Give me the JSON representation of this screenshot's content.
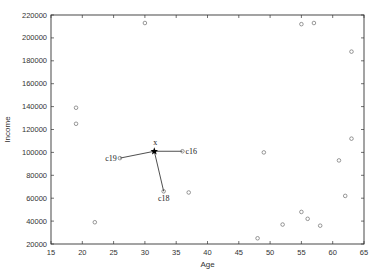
{
  "chart_data": {
    "type": "scatter",
    "title": "",
    "xlabel": "Age",
    "ylabel": "Income",
    "xlim": [
      15,
      65
    ],
    "ylim": [
      20000,
      220000
    ],
    "xticks": [
      "15",
      "20",
      "25",
      "30",
      "35",
      "40",
      "45",
      "50",
      "55",
      "60",
      "65"
    ],
    "yticks": [
      "20000",
      "40000",
      "60000",
      "80000",
      "100000",
      "120000",
      "140000",
      "160000",
      "180000",
      "200000",
      "220000"
    ],
    "grid": false,
    "legend": null,
    "points": [
      {
        "x": 19,
        "y": 139000
      },
      {
        "x": 19,
        "y": 125000
      },
      {
        "x": 22,
        "y": 39000
      },
      {
        "x": 26,
        "y": 95000,
        "label": "c19"
      },
      {
        "x": 36,
        "y": 101000,
        "label": "c16"
      },
      {
        "x": 33,
        "y": 66000,
        "label": "c18"
      },
      {
        "x": 37,
        "y": 65000
      },
      {
        "x": 30,
        "y": 213000
      },
      {
        "x": 49,
        "y": 100000
      },
      {
        "x": 48,
        "y": 25000
      },
      {
        "x": 52,
        "y": 37000
      },
      {
        "x": 55,
        "y": 48000
      },
      {
        "x": 56,
        "y": 42000
      },
      {
        "x": 58,
        "y": 36000
      },
      {
        "x": 55,
        "y": 212000
      },
      {
        "x": 57,
        "y": 213000
      },
      {
        "x": 63,
        "y": 188000
      },
      {
        "x": 61,
        "y": 93000
      },
      {
        "x": 62,
        "y": 62000
      },
      {
        "x": 63,
        "y": 112000
      }
    ],
    "query_point": {
      "x": 31.5,
      "y": 101000,
      "label": "x",
      "marker": "star"
    },
    "neighbors": [
      "c19",
      "c16",
      "c18"
    ]
  }
}
